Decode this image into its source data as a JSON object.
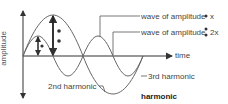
{
  "diagram": {
    "axes": {
      "y_label": "amplitude",
      "x_label": "time"
    },
    "labels": {
      "wave_amp_x": "wave of amplitude",
      "wave_amp_x_suffix": "x",
      "wave_amp_2x": "wave of amplitude",
      "wave_amp_2x_suffix": "2x",
      "second_harmonic": "2nd harmonic",
      "third_harmonic": "3rd harmonic",
      "caption": "harmonic"
    },
    "colors": {
      "line": "#555555",
      "axis": "#333333",
      "text": "#444444"
    }
  }
}
